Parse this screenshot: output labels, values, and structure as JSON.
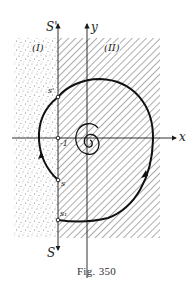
{
  "figure": {
    "caption": "Fig. 350",
    "regions": [
      {
        "id": "I",
        "label": "(I)",
        "fill": "stippled"
      },
      {
        "id": "II",
        "label": "(II)",
        "fill": "hatched"
      }
    ],
    "axes": {
      "x_label": "x",
      "y_label": "y",
      "s_prime_label": "S'",
      "s_label": "S"
    },
    "points": {
      "s_prime": "s'",
      "s": "s",
      "s1": "s₁",
      "minus_one": "-1"
    },
    "colors": {
      "ink": "#1a1a1a",
      "hatch": "#555555",
      "background": "#ffffff"
    }
  }
}
